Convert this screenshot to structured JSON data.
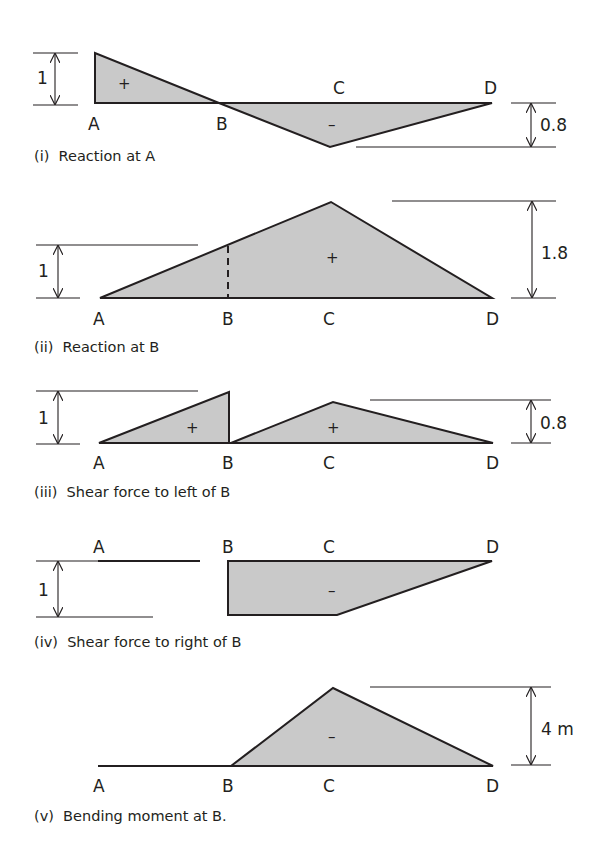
{
  "figure": {
    "points": [
      "A",
      "B",
      "C",
      "D"
    ],
    "fill_color": "#c9c9c9",
    "line_color": "#231f20",
    "diagrams": [
      {
        "id": "i",
        "caption": "(i)  Reaction at A",
        "ordinates": {
          "A": 1,
          "B": 0,
          "C": -0.8,
          "D": 0
        },
        "signs": [
          "+",
          "–"
        ],
        "dimensions": [
          {
            "label": "1",
            "side": "left"
          },
          {
            "label": "0.8",
            "side": "right"
          }
        ]
      },
      {
        "id": "ii",
        "caption": "(ii)  Reaction at B",
        "ordinates": {
          "A": 0,
          "B": 1,
          "C": 1.8,
          "D": 0
        },
        "signs": [
          "+"
        ],
        "dimensions": [
          {
            "label": "1",
            "side": "left"
          },
          {
            "label": "1.8",
            "side": "right"
          }
        ]
      },
      {
        "id": "iii",
        "caption": "(iii)  Shear force to left of B",
        "ordinates": {
          "A": 0,
          "B_left": 1,
          "B_right": 0,
          "C": 0.8,
          "D": 0
        },
        "signs": [
          "+",
          "+"
        ],
        "dimensions": [
          {
            "label": "1",
            "side": "left"
          },
          {
            "label": "0.8",
            "side": "right"
          }
        ]
      },
      {
        "id": "iv",
        "caption": "(iv)  Shear force to right of B",
        "ordinates": {
          "A": 0,
          "B_left": 0,
          "B_right": -1,
          "C": -1,
          "D": 0
        },
        "signs": [
          "–"
        ],
        "dimensions": [
          {
            "label": "1",
            "side": "left"
          }
        ]
      },
      {
        "id": "v",
        "caption": "(v)  Bending moment at B.",
        "ordinates": {
          "A": 0,
          "B": 0,
          "C": -4,
          "D": 0
        },
        "signs": [
          "–"
        ],
        "dimensions": [
          {
            "label": "4 m",
            "side": "right"
          }
        ]
      }
    ]
  }
}
